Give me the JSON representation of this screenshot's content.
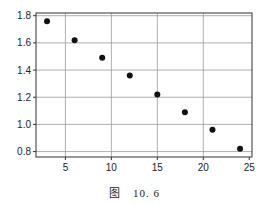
{
  "chart_data": {
    "type": "scatter",
    "title": "",
    "xlabel": "",
    "ylabel": "",
    "xlim": [
      1.8,
      25.3
    ],
    "ylim": [
      0.76,
      1.82
    ],
    "xticks": [
      5,
      10,
      15,
      20,
      25
    ],
    "yticks": [
      0.8,
      1.0,
      1.2,
      1.4,
      1.6,
      1.8
    ],
    "xtick_labels": [
      "5",
      "10",
      "15",
      "20",
      "25"
    ],
    "ytick_labels": [
      "0.8",
      "1.0",
      "1.2",
      "1.4",
      "1.6",
      "1.8"
    ],
    "grid": true,
    "legend": null,
    "series": [
      {
        "name": "data",
        "x": [
          3,
          6,
          9,
          12,
          15,
          18,
          21,
          24
        ],
        "y": [
          1.76,
          1.62,
          1.49,
          1.36,
          1.22,
          1.09,
          0.96,
          0.82
        ]
      }
    ],
    "marker_color": "#111111"
  },
  "caption": {
    "prefix": "图",
    "number": "10. 6"
  }
}
